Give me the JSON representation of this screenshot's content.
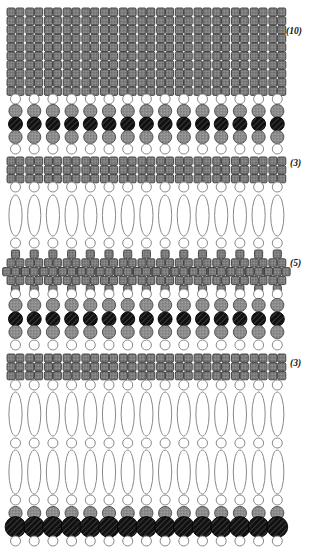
{
  "figure": {
    "canvas": {
      "width": 312,
      "height": 549,
      "background": "#ffffff"
    },
    "columns": {
      "count": 15,
      "pitch": 18.7,
      "first_center_x": 15.5
    },
    "palette": {
      "square_fill": "#808080",
      "square_stroke": "#3a3a3a",
      "grey_circle_fill": "#8f8f8f",
      "grey_circle_stroke": "#4a4a4a",
      "black_circle_fill": "#121212",
      "black_circle_stroke": "#000000",
      "hatch_stroke": "#555555",
      "open_circle_fill": "#ffffff",
      "open_circle_stroke": "#8a8a8a",
      "ellipse_fill": "#ffffff",
      "ellipse_stroke": "#8a8a8a",
      "label_color": "#111111"
    },
    "annotations": [
      {
        "name": "count-10",
        "text": "(10)",
        "x": 286,
        "y": 34
      },
      {
        "name": "count-3-upper",
        "text": "(3)",
        "x": 290,
        "y": 166
      },
      {
        "name": "count-5",
        "text": "(5)",
        "x": 290,
        "y": 266
      },
      {
        "name": "count-3-lower",
        "text": "(3)",
        "x": 290,
        "y": 366
      }
    ],
    "bands": [
      {
        "name": "square-stack-10",
        "kind": "square-stack",
        "rows": 10,
        "cols": 2,
        "y_top": 8,
        "y_bottom": 92,
        "label": "(10)"
      },
      {
        "name": "open-circle-row-1",
        "kind": "open-circle",
        "y": 99
      },
      {
        "name": "grey-circle-row-1",
        "kind": "grey-circle",
        "y": 111
      },
      {
        "name": "black-circle-row-1",
        "kind": "black-circle",
        "y": 124
      },
      {
        "name": "grey-circle-row-2",
        "kind": "grey-circle",
        "y": 137
      },
      {
        "name": "open-circle-row-2",
        "kind": "open-circle",
        "y": 149
      },
      {
        "name": "square-block-3-upper",
        "kind": "square-block",
        "rows": 3,
        "cols": 2,
        "y_top": 157,
        "y_bottom": 180,
        "label": "(3)"
      },
      {
        "name": "open-circle-row-3",
        "kind": "open-circle",
        "y": 187
      },
      {
        "name": "ellipse-row-1",
        "kind": "ellipse",
        "y_top": 195,
        "y_bottom": 236
      },
      {
        "name": "open-circle-row-4",
        "kind": "open-circle",
        "y": 243
      },
      {
        "name": "square-diamond-5",
        "kind": "square-diamond",
        "rows": 5,
        "y_top": 250,
        "y_bottom": 288,
        "label": "(5)"
      },
      {
        "name": "open-circle-row-5",
        "kind": "open-circle",
        "y": 294
      },
      {
        "name": "grey-circle-row-3",
        "kind": "grey-circle",
        "y": 305
      },
      {
        "name": "black-circle-row-2",
        "kind": "black-circle",
        "y": 319
      },
      {
        "name": "grey-circle-row-4",
        "kind": "grey-circle",
        "y": 332
      },
      {
        "name": "open-circle-row-6",
        "kind": "open-circle",
        "y": 345
      },
      {
        "name": "square-block-3-lower",
        "kind": "square-block",
        "rows": 3,
        "cols": 2,
        "y_top": 354,
        "y_bottom": 377,
        "label": "(3)"
      },
      {
        "name": "open-circle-row-7",
        "kind": "open-circle",
        "y": 385
      },
      {
        "name": "ellipse-row-2",
        "kind": "ellipse",
        "y_top": 392,
        "y_bottom": 436
      },
      {
        "name": "open-circle-row-8",
        "kind": "open-circle",
        "y": 443
      },
      {
        "name": "ellipse-row-3",
        "kind": "ellipse",
        "y_top": 450,
        "y_bottom": 494
      },
      {
        "name": "open-circle-row-9",
        "kind": "open-circle",
        "y": 500
      },
      {
        "name": "grey-circle-row-5",
        "kind": "grey-circle",
        "y": 513
      },
      {
        "name": "black-circle-large-row",
        "kind": "black-circle-large",
        "y": 527
      },
      {
        "name": "open-circle-row-10",
        "kind": "open-circle",
        "y": 541
      }
    ],
    "geometry": {
      "square_w": 8.1,
      "square_h": 8.2,
      "square_gap_x": 0.7,
      "square_gap_y": 0.6,
      "square_radius": 1.4,
      "open_circle_r": 5.0,
      "grey_circle_r": 6.6,
      "black_circle_r": 7.0,
      "black_circle_large_r": 10.4,
      "ellipse_rx": 6.6
    }
  }
}
